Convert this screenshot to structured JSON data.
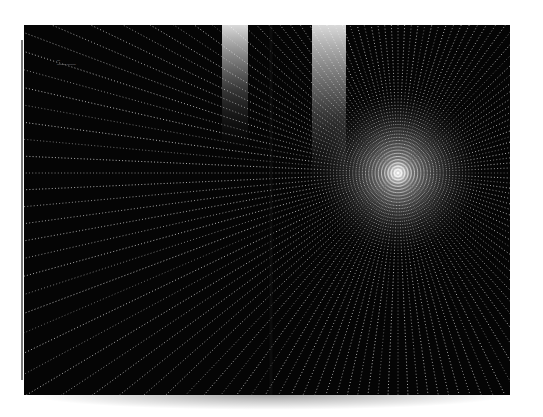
{
  "scene": {
    "description": "Photograph of an open magazine spread showing a black starburst image of dotted light rays",
    "background_color": "#ffffff",
    "page_color": "#050505",
    "ray_color": "#e8e8e8"
  },
  "spread": {
    "left_page": {
      "caption_line_1": "—",
      "caption_line_2": "——— ———"
    },
    "right_page": {
      "burst_center": {
        "x": 398,
        "y": 173
      }
    },
    "light_beams": [
      {
        "x": 222,
        "width": 26
      },
      {
        "x": 312,
        "width": 34
      }
    ]
  }
}
